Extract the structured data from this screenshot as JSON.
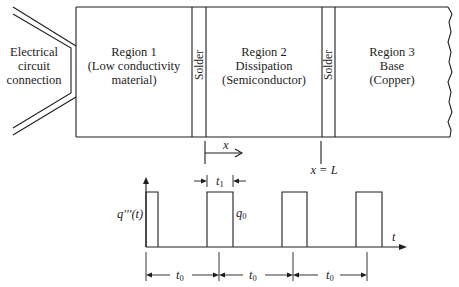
{
  "diagram": {
    "electrical": {
      "line1": "Electrical",
      "line2": "circuit",
      "line3": "connection"
    },
    "region1": {
      "line1": "Region 1",
      "line2": "(Low conductivity",
      "line3": "material)"
    },
    "solder1": {
      "label": "Solder"
    },
    "region2": {
      "line1": "Region 2",
      "line2": "Dissipation",
      "line3": "(Semiconductor)"
    },
    "solder2": {
      "label": "Solder"
    },
    "region3": {
      "line1": "Region 3",
      "line2": "Base",
      "line3": "(Copper)"
    },
    "position": {
      "x_label": "x",
      "x_equals_L": "x = L"
    },
    "pulse_chart": {
      "y_label": "q′′′(t)",
      "amplitude": {
        "base": "q",
        "sub": "0"
      },
      "time_axis_label": "t",
      "pulse_width": {
        "base": "t",
        "sub": "1"
      },
      "periods": [
        {
          "base": "t",
          "sub": "0"
        },
        {
          "base": "t",
          "sub": "0"
        },
        {
          "base": "t",
          "sub": "0"
        }
      ]
    }
  }
}
